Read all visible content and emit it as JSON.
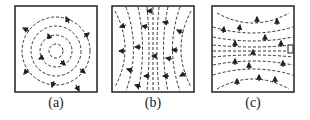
{
  "figure": {
    "panels": [
      {
        "id": "a",
        "label": "(a)",
        "pattern": "concentric-circles",
        "description": "closed circular dashed field lines with arrows"
      },
      {
        "id": "b",
        "label": "(b)",
        "pattern": "hyperbolic-vertical",
        "description": "vertical dashed lines bowing outward with leftward arrows"
      },
      {
        "id": "c",
        "label": "(c)",
        "pattern": "hyperbolic-horizontal",
        "description": "horizontal dashed lines bowing outward with upward arrows"
      }
    ]
  },
  "colors": {
    "stroke": "#222222",
    "background": "#ffffff"
  }
}
